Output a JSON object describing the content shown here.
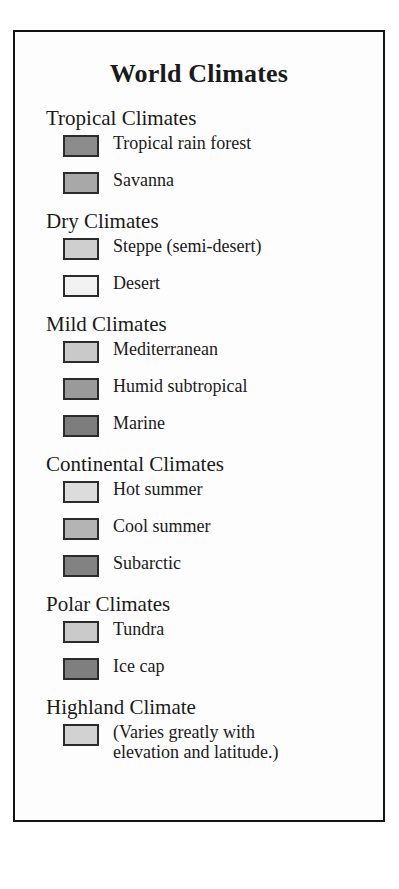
{
  "legend": {
    "title": "World Climates",
    "border_color": "#141414",
    "background_color": "#fdfdfd",
    "groups": [
      {
        "header": "Tropical Climates",
        "items": [
          {
            "label": "Tropical rain forest",
            "color": "#8c8c8c"
          },
          {
            "label": "Savanna",
            "color": "#a8a8a8"
          }
        ]
      },
      {
        "header": "Dry Climates",
        "items": [
          {
            "label": "Steppe (semi-desert)",
            "color": "#cfcfcf"
          },
          {
            "label": "Desert",
            "color": "#f2f2f2"
          }
        ]
      },
      {
        "header": "Mild Climates",
        "items": [
          {
            "label": "Mediterranean",
            "color": "#c9c9c9"
          },
          {
            "label": "Humid subtropical",
            "color": "#9a9a9a"
          },
          {
            "label": "Marine",
            "color": "#7d7d7d"
          }
        ]
      },
      {
        "header": "Continental Climates",
        "items": [
          {
            "label": "Hot summer",
            "color": "#dcdcdc"
          },
          {
            "label": "Cool summer",
            "color": "#b4b4b4"
          },
          {
            "label": "Subarctic",
            "color": "#828282"
          }
        ]
      },
      {
        "header": "Polar Climates",
        "items": [
          {
            "label": "Tundra",
            "color": "#cacaca"
          },
          {
            "label": "Ice cap",
            "color": "#7f7f7f"
          }
        ]
      },
      {
        "header": "Highland Climate",
        "items": [
          {
            "label": "(Varies greatly with elevation and latitude.)",
            "color": "#d2d2d2",
            "wrap": true
          }
        ]
      }
    ]
  }
}
